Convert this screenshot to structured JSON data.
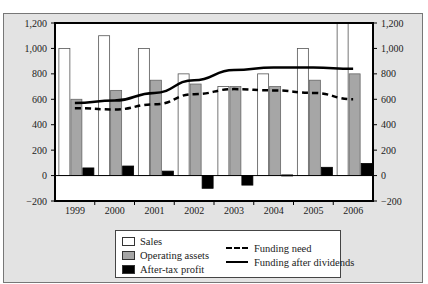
{
  "chart_data": {
    "type": "bar",
    "title": "",
    "xlabel": "",
    "ylabel": "",
    "ylim": [
      -200,
      1200
    ],
    "yticks": [
      -200,
      0,
      200,
      400,
      600,
      800,
      1000,
      1200
    ],
    "ytick_labels": [
      "−200",
      "0",
      "200",
      "400",
      "600",
      "800",
      "1,000",
      "1,200"
    ],
    "secondary_axis": true,
    "grid": false,
    "legend_position": "bottom",
    "categories": [
      "1999",
      "2000",
      "2001",
      "2002",
      "2003",
      "2004",
      "2005",
      "2006"
    ],
    "series": [
      {
        "name": "Sales",
        "kind": "bar",
        "color": "#ffffff",
        "values": [
          1000,
          1100,
          1000,
          800,
          700,
          800,
          1000,
          1200
        ]
      },
      {
        "name": "Operating assets",
        "kind": "bar",
        "color": "#a6a6a6",
        "values": [
          600,
          670,
          750,
          720,
          700,
          700,
          750,
          800
        ]
      },
      {
        "name": "After-tax profit",
        "kind": "bar",
        "color": "#000000",
        "values": [
          60,
          75,
          35,
          -100,
          -75,
          5,
          65,
          95
        ]
      },
      {
        "name": "Funding need",
        "kind": "line",
        "style": "dashed",
        "color": "#000000",
        "values": [
          530,
          520,
          560,
          640,
          680,
          670,
          650,
          600
        ]
      },
      {
        "name": "Funding after dividends",
        "kind": "line",
        "style": "solid",
        "color": "#000000",
        "values": [
          570,
          590,
          650,
          750,
          830,
          850,
          850,
          840
        ]
      }
    ]
  },
  "legend": {
    "items": [
      {
        "label": "Sales"
      },
      {
        "label": "Operating assets"
      },
      {
        "label": "After-tax profit"
      },
      {
        "label": "Funding need"
      },
      {
        "label": "Funding after dividends"
      }
    ]
  }
}
